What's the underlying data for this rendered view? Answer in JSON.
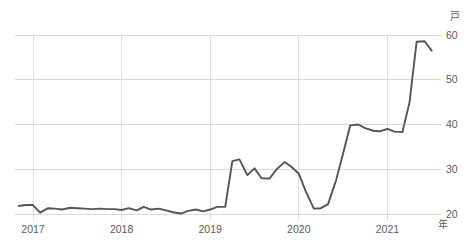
{
  "chart_data": {
    "type": "line",
    "title": "",
    "subtitle": "",
    "xlabel": "年",
    "ylabel": "戸",
    "unit_top_right": "戸",
    "unit_bottom_right": "年",
    "xlim": [
      2016.82,
      2021.55
    ],
    "ylim": [
      18.0,
      62.0
    ],
    "xticks": [
      2017,
      2018,
      2019,
      2020,
      2021
    ],
    "xtick_labels": [
      "2017",
      "2018",
      "2019",
      "2020",
      "2021"
    ],
    "yticks": [
      20,
      30,
      40,
      50,
      60
    ],
    "ytick_labels": [
      "20",
      "30",
      "40",
      "50",
      "60"
    ],
    "grid": true,
    "grid_axes": "both",
    "legend": false,
    "legend_position": "none",
    "line_color": "#555555",
    "grid_color": "#cfcfcf",
    "background_color": "#ffffff",
    "series": [
      {
        "name": "series-1",
        "x": [
          2016.84,
          2016.92,
          2017.0,
          2017.08,
          2017.17,
          2017.25,
          2017.33,
          2017.42,
          2017.5,
          2017.58,
          2017.67,
          2017.75,
          2017.84,
          2017.92,
          2018.0,
          2018.08,
          2018.17,
          2018.25,
          2018.33,
          2018.42,
          2018.5,
          2018.58,
          2018.67,
          2018.75,
          2018.84,
          2018.92,
          2019.0,
          2019.08,
          2019.17,
          2019.25,
          2019.33,
          2019.42,
          2019.5,
          2019.58,
          2019.67,
          2019.75,
          2019.84,
          2019.92,
          2020.0,
          2020.08,
          2020.17,
          2020.25,
          2020.33,
          2020.42,
          2020.5,
          2020.58,
          2020.67,
          2020.75,
          2020.84,
          2020.92,
          2021.0,
          2021.08,
          2021.17,
          2021.25,
          2021.33,
          2021.42,
          2021.5
        ],
        "y": [
          21.8,
          22.0,
          22.0,
          20.3,
          21.3,
          21.2,
          21.0,
          21.4,
          21.3,
          21.2,
          21.1,
          21.2,
          21.1,
          21.1,
          20.9,
          21.3,
          20.8,
          21.6,
          21.0,
          21.2,
          20.8,
          20.4,
          20.1,
          20.7,
          21.0,
          20.6,
          21.0,
          21.6,
          21.6,
          31.8,
          32.2,
          28.7,
          30.2,
          28.0,
          27.9,
          30.0,
          31.6,
          30.5,
          29.0,
          25.0,
          21.2,
          21.3,
          22.2,
          27.5,
          33.5,
          39.8,
          40.0,
          39.2,
          38.6,
          38.5,
          39.0,
          38.4,
          38.3,
          45.0,
          58.5,
          58.6,
          56.5
        ]
      }
    ],
    "annotations": [],
    "notable_points": {
      "minimum": {
        "x": 2018.67,
        "y": 20.1
      },
      "maximum": {
        "x": 2021.42,
        "y": 58.6
      },
      "last": {
        "x": 2021.5,
        "y": 56.5
      },
      "first_jump": {
        "x": 2019.25,
        "y": 31.8
      },
      "covid_trough": {
        "x": 2020.17,
        "y": 21.2
      }
    }
  }
}
